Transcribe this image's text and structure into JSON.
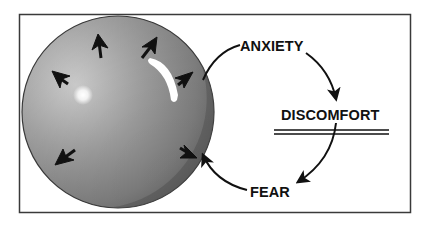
{
  "diagram": {
    "labels": {
      "anxiety": "ANXIETY",
      "discomfort": "DISCOMFORT",
      "fear": "FEAR"
    },
    "cycle_order": [
      "ANXIETY",
      "DISCOMFORT",
      "FEAR",
      "balloon"
    ],
    "balloon": {
      "description": "Inflated gray balloon with outward-pointing arrows indicating pressure",
      "outward_arrow_count": 6
    },
    "colors": {
      "frame": "#3a3a3a",
      "balloon_light": "#c9c9c9",
      "balloon_mid": "#9a9a9a",
      "balloon_dark": "#6a6a6a",
      "text": "#111111",
      "arrow": "#111111"
    }
  }
}
